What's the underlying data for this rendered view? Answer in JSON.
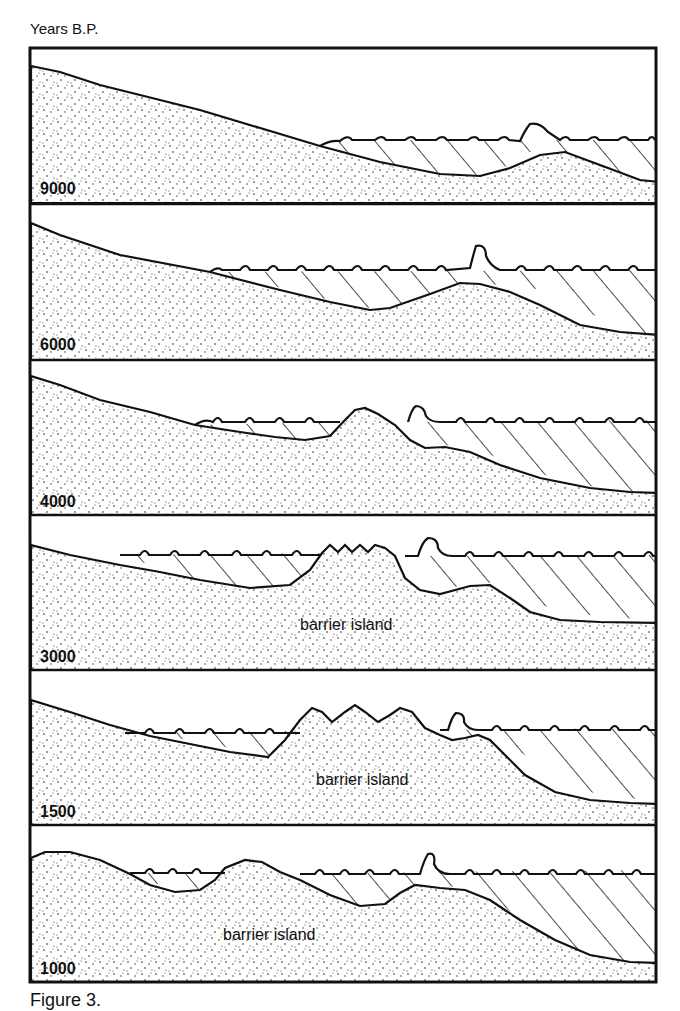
{
  "figure": {
    "axis_title": "Years B.P.",
    "caption_visible": "Figure 3.",
    "caption_note": "caption text cut off at image bottom",
    "colors": {
      "ink": "#111111",
      "background": "#ffffff"
    },
    "legend_semantics": {
      "stippled": "sand / barrier sediment",
      "hatched": "water body (lagoon / ocean)",
      "wavy_line": "water surface with waves"
    },
    "panels": [
      {
        "years_bp": "9000",
        "island_label": "",
        "description": "Sloping shelf; sea surface transgressing with a small submerged sand bar offshore"
      },
      {
        "years_bp": "6000",
        "island_label": "",
        "description": "Sea level higher; sand bar forming beneath breaking wave"
      },
      {
        "years_bp": "4000",
        "island_label": "",
        "description": "Sand bar emerges above sea level, separating lagoon from ocean"
      },
      {
        "years_bp": "3000",
        "island_label": "barrier island",
        "description": "Barrier island with dunes; lagoon landward, ocean seaward"
      },
      {
        "years_bp": "1500",
        "island_label": "barrier island",
        "description": "Barrier island widens with multiple dunes; lagoon narrows"
      },
      {
        "years_bp": "1000",
        "island_label": "barrier island",
        "description": "Barrier island migrates; mainland and island dunes with two small lagoons"
      }
    ]
  }
}
